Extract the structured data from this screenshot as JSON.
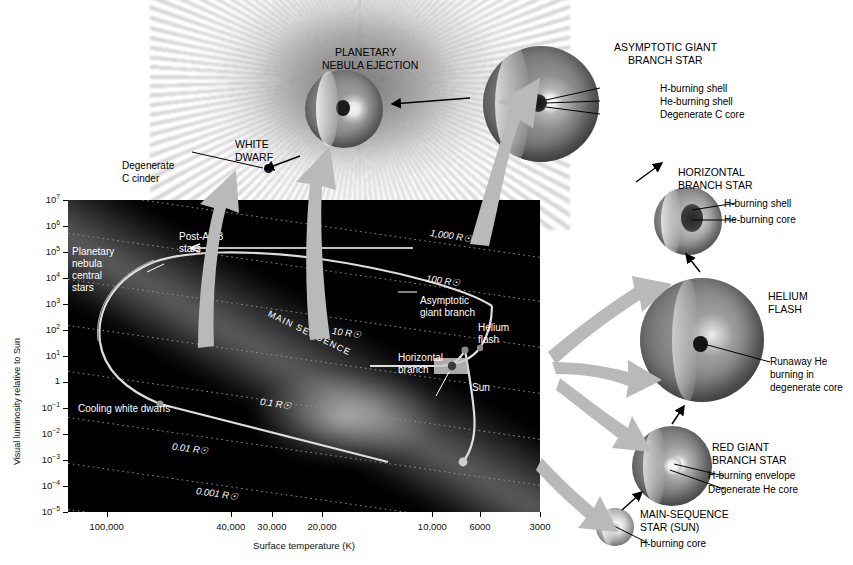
{
  "chart_data": {
    "type": "scatter",
    "xlabel": "Surface temperature (K)",
    "ylabel": "Visual luminosity relative to Sun",
    "x_ticks": [
      "100,000",
      "40,000",
      "30,000",
      "20,000",
      "10,000",
      "6000",
      "3000"
    ],
    "x_tick_positions": [
      0.082,
      0.345,
      0.432,
      0.538,
      0.772,
      0.873,
      1.0
    ],
    "xlim_note": "logarithmic, reversed (hot left to cool right)",
    "y_ticks": [
      "10⁷",
      "10⁶",
      "10⁵",
      "10⁴",
      "10³",
      "10²",
      "10¹",
      "1",
      "10⁻¹",
      "10⁻²",
      "10⁻³",
      "10⁻⁴",
      "10⁻⁵"
    ],
    "ylim": [
      "1e-5",
      "1e7"
    ],
    "grid": "dotted constant-radius lines",
    "radius_lines": [
      "1,000 R☉",
      "100 R☉",
      "10 R☉",
      "0.1 R☉",
      "0.01 R☉",
      "0.001 R☉"
    ],
    "annotations": [
      "MAIN SEQUENCE",
      "Post-AGB stars",
      "Planetary nebula central stars",
      "Cooling white dwarfs",
      "Asymptotic giant branch",
      "Horizontal branch",
      "Helium flash",
      "Sun"
    ],
    "track_points": [
      {
        "label": "Sun",
        "x_temp": 5800,
        "y_lum": 1
      },
      {
        "label": "Helium flash",
        "x_temp": 4200,
        "y_lum": 1000
      },
      {
        "label": "Horizontal branch",
        "x_temp": 6000,
        "y_lum": 60
      },
      {
        "label": "Asymptotic giant branch tip",
        "x_temp": 3500,
        "y_lum": 3000
      },
      {
        "label": "Post-AGB",
        "x_temp": 30000,
        "y_lum": 3000
      }
    ]
  },
  "axes": {
    "y_label": "Visual luminosity relative to Sun",
    "x_label": "Surface temperature (K)",
    "y_ticks": [
      {
        "mant": "10",
        "exp": "7"
      },
      {
        "mant": "10",
        "exp": "6"
      },
      {
        "mant": "10",
        "exp": "5"
      },
      {
        "mant": "10",
        "exp": "4"
      },
      {
        "mant": "10",
        "exp": "3"
      },
      {
        "mant": "10",
        "exp": "2"
      },
      {
        "mant": "10",
        "exp": "1"
      },
      {
        "mant": "1",
        "exp": ""
      },
      {
        "mant": "10",
        "exp": "−1"
      },
      {
        "mant": "10",
        "exp": "−2"
      },
      {
        "mant": "10",
        "exp": "−3"
      },
      {
        "mant": "10",
        "exp": "−4"
      },
      {
        "mant": "10",
        "exp": "−5"
      }
    ],
    "x_ticks": [
      "100,000",
      "40,000",
      "30,000",
      "20,000",
      "10,000",
      "6000",
      "3000"
    ]
  },
  "plot_labels": {
    "main_sequence": "MAIN SEQUENCE",
    "post_agb_1": "Post-AGB",
    "post_agb_2": "stars",
    "pn_central_1": "Planetary",
    "pn_central_2": "nebula",
    "pn_central_3": "central",
    "pn_central_4": "stars",
    "cooling_wd": "Cooling white dwarfs",
    "agb_1": "Asymptotic",
    "agb_2": "giant branch",
    "hb_1": "Horizontal",
    "hb_2": "branch",
    "he_flash_1": "Helium",
    "he_flash_2": "flash",
    "sun": "Sun",
    "r1000": "1,000 R☉",
    "r100": "100 R☉",
    "r10": "10 R☉",
    "r01": "0.1 R☉",
    "r001": "0.01 R☉",
    "r0001": "0.001 R☉"
  },
  "stages": {
    "planetary_nebula": {
      "title_1": "PLANETARY",
      "title_2": "NEBULA EJECTION"
    },
    "white_dwarf": {
      "title_1": "WHITE",
      "title_2": "DWARF",
      "lead_1": "Degenerate",
      "lead_2": "C cinder"
    },
    "agb": {
      "title_1": "ASYMPTOTIC GIANT",
      "title_2": "BRANCH STAR",
      "leads": [
        "H-burning shell",
        "He-burning shell",
        "Degenerate C core"
      ]
    },
    "horizontal_branch": {
      "title_1": "HORIZONTAL",
      "title_2": "BRANCH STAR",
      "leads": [
        "H-burning shell",
        "He-burning core"
      ]
    },
    "helium_flash": {
      "title_1": "HELIUM",
      "title_2": "FLASH",
      "lead_1": "Runaway He",
      "lead_2": "burning in",
      "lead_3": "degenerate core"
    },
    "red_giant": {
      "title_1": "RED GIANT",
      "title_2": "BRANCH STAR",
      "leads": [
        "H-burning envelope",
        "Degenerate He core"
      ]
    },
    "main_sequence_star": {
      "title_1": "MAIN-SEQUENCE",
      "title_2": "STAR (SUN)",
      "lead_1": "H-burning core"
    }
  },
  "colors": {
    "plot_background": "#000000",
    "page_background": "#ffffff",
    "track_line": "#d8d8d8",
    "grid_dotted": "#9a9a9a",
    "flow_arrow": "#b4b4b4",
    "pointer_arrow": "#000000",
    "text_light": "#ffffff",
    "text_dark": "#000000"
  },
  "icons": {
    "sun_symbol": "☉",
    "arrow": "arrow-icon"
  }
}
